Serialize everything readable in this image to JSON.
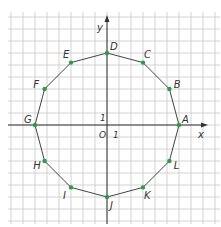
{
  "diagram": {
    "type": "regular-dodecagon-on-coordinate-grid",
    "axes": {
      "x_label": "x",
      "y_label": "y",
      "origin_label": "O",
      "unit_x_label": "1",
      "unit_y_label": "1"
    },
    "grid": {
      "x_range": [
        -8,
        9
      ],
      "y_range": [
        -8,
        9
      ],
      "unit": 1
    },
    "colors": {
      "grid": "#c8c8c8",
      "axis": "#333333",
      "polygon": "#444444",
      "point": "#2e9a4a",
      "text": "#333333"
    },
    "points": [
      {
        "label": "A",
        "x": 6,
        "y": 0
      },
      {
        "label": "B",
        "x": 5.2,
        "y": 3
      },
      {
        "label": "C",
        "x": 3,
        "y": 5.2
      },
      {
        "label": "D",
        "x": 0,
        "y": 6
      },
      {
        "label": "E",
        "x": -3,
        "y": 5.2
      },
      {
        "label": "F",
        "x": -5.2,
        "y": 3
      },
      {
        "label": "G",
        "x": -6,
        "y": 0
      },
      {
        "label": "H",
        "x": -5.2,
        "y": -3
      },
      {
        "label": "I",
        "x": -3,
        "y": -5.2
      },
      {
        "label": "J",
        "x": 0,
        "y": -6
      },
      {
        "label": "K",
        "x": 3,
        "y": -5.2
      },
      {
        "label": "L",
        "x": 5.2,
        "y": -3
      }
    ]
  }
}
